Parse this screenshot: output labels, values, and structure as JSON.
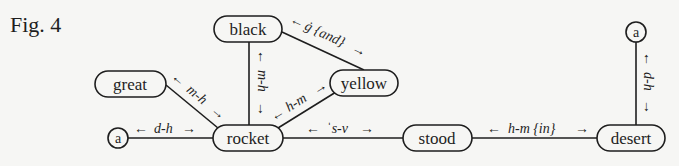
{
  "figure": {
    "title": "Fig. 4"
  },
  "nodes": {
    "black": "black",
    "yellow": "yellow",
    "great": "great",
    "a_left": "a",
    "rocket": "rocket",
    "stood": "stood",
    "desert": "desert",
    "a_right": "a"
  },
  "edges": {
    "black_yellow": "ġ {and}",
    "black_rocket": "m-h",
    "great_rocket": "m-h",
    "yellow_rocket": "h-m",
    "a_rocket": "d-h",
    "rocket_stood": "ˈs-v",
    "stood_desert": "h-m {in}",
    "a_desert": "d-h"
  },
  "arrows": {
    "left": "←",
    "right": "→",
    "up": "↑",
    "down": "↓"
  }
}
